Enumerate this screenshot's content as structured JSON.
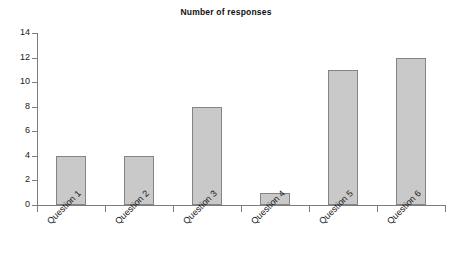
{
  "chart_data": {
    "type": "bar",
    "title": "Number of responses",
    "xlabel": "",
    "ylabel": "",
    "categories": [
      "Question 1",
      "Question 2",
      "Question 3",
      "Question 4",
      "Question 5",
      "Question 6"
    ],
    "values": [
      4,
      4,
      8,
      1,
      11,
      12
    ],
    "ylim": [
      0,
      14
    ],
    "ytick_labels": [
      "0",
      "2",
      "4",
      "6",
      "8",
      "10",
      "12",
      "14"
    ],
    "ytick_values": [
      0,
      2,
      4,
      6,
      8,
      10,
      12,
      14
    ],
    "grid": false,
    "legend": false,
    "legend_position": "none",
    "bar_fill_color": "#c9c9c9",
    "bar_border_color": "#848484",
    "axis_color": "#7d7d7d",
    "background_color": "#ffffff",
    "xlabel_rotation_deg": -45
  }
}
